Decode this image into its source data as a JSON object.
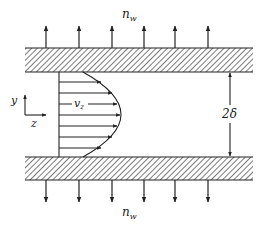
{
  "labels": {
    "top_flux": "n",
    "top_flux_sub": "w",
    "bottom_flux": "n",
    "bottom_flux_sub": "w",
    "velocity": "v",
    "velocity_sub": "z",
    "axis_y": "y",
    "axis_z": "z",
    "gap": "2δ"
  },
  "colors": {
    "ink": "#222222",
    "background": "#ffffff"
  },
  "geometry": {
    "wall_left": 25,
    "wall_right": 253,
    "top_wall": [
      48,
      72
    ],
    "bottom_wall": [
      157,
      180
    ],
    "flux_arrow_x": [
      46,
      79,
      112,
      144,
      175,
      208
    ],
    "profile_base_x": 59,
    "profile_peak_x": 121,
    "profile_arrows_count": 8
  }
}
